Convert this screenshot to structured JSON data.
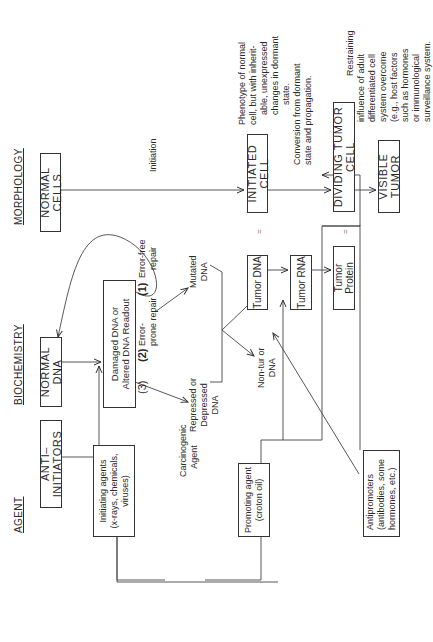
{
  "headers": {
    "agent": "AGENT",
    "biochemistry": "BIOCHEMISTRY",
    "morphology": "MORPHOLOGY"
  },
  "agent_column": {
    "anti_initiators": "ANTI–INITIATORS",
    "initiating_agents": [
      "Initiating agents",
      "(x-rays, chemicals,",
      "viruses)"
    ],
    "promoting_agent": [
      "Promoting agent",
      "(croton oil)"
    ],
    "antipromoters": [
      "Antipromoters",
      "(antibodies, some",
      "hormones, etc.)"
    ],
    "carcinogenic_agent": [
      "Carcinogenic",
      "Agent"
    ]
  },
  "biochemistry_column": {
    "normal_dna": "NORMAL DNA",
    "damaged_dna": [
      "Damaged DNA or",
      "Altered DNA Readout"
    ],
    "repair_1_num": "(1)",
    "repair_1": [
      "Error-free",
      "repair"
    ],
    "repair_2_num": "(2)",
    "repair_2": [
      "Error-",
      "prone repair"
    ],
    "repair_3_num": "(3)",
    "mutated_dna": [
      "Mutated",
      "DNA"
    ],
    "repressed_dna": [
      "Repressed or",
      "Depressed",
      "DNA"
    ],
    "non_tumor_dna": [
      "Non-tur or",
      "DNA"
    ],
    "tumor_dna": "Tumor DNA",
    "tumor_rna": "Tumor RNA",
    "tumor_protein": "Tumor Protein",
    "equals_1": "=",
    "equals_2": "="
  },
  "morphology_column": {
    "normal_cells": "NORMAL CELLS",
    "initiation": "Initiation",
    "initiated_cell": "INITIATED CELL",
    "initiated_note": [
      "Phenotype of normal",
      "cell, but with inherit-",
      "able, unexpressed",
      "changes in dormant",
      "state."
    ],
    "conversion_note": [
      "Conversion from dormant",
      "state and propagation."
    ],
    "dividing_tumor_cell": "DIVIDING TUMOR CELL",
    "restraining_note": [
      "Restraining",
      "influence of adult",
      "differentiated cell",
      "system overcome",
      "(e.g., host factors",
      "such as hormones",
      "or immunological",
      "surveillance system."
    ],
    "visible_tumor": "VISIBLE TUMOR"
  }
}
